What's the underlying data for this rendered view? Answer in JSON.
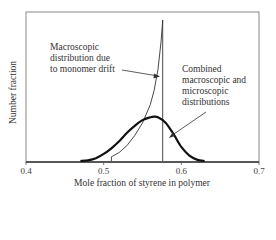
{
  "chart_data": {
    "type": "line",
    "title": "",
    "xlabel": "Mole fraction of styrene in polymer",
    "ylabel": "Number fraction",
    "xlim": [
      0.4,
      0.7
    ],
    "xticks": [
      "0.4",
      "0.5",
      "0.6",
      "0.7"
    ],
    "yticks": [],
    "grid": false,
    "legend": null,
    "series": [
      {
        "name": "Macroscopic distribution due to monomer drift",
        "style": "thin",
        "x": [
          0.51,
          0.51,
          0.52,
          0.53,
          0.54,
          0.55,
          0.56,
          0.565,
          0.57,
          0.574,
          0.576,
          0.576
        ],
        "y": [
          0.0,
          0.03,
          0.06,
          0.11,
          0.18,
          0.27,
          0.4,
          0.5,
          0.65,
          0.85,
          1.0,
          0.0
        ]
      },
      {
        "name": "Combined macroscopic and microscopic distributions",
        "style": "bold",
        "x": [
          0.47,
          0.48,
          0.49,
          0.5,
          0.51,
          0.52,
          0.53,
          0.54,
          0.55,
          0.56,
          0.565,
          0.57,
          0.58,
          0.59,
          0.6,
          0.61,
          0.62,
          0.63
        ],
        "y": [
          0.0,
          0.005,
          0.02,
          0.05,
          0.09,
          0.14,
          0.2,
          0.25,
          0.29,
          0.31,
          0.315,
          0.31,
          0.27,
          0.19,
          0.1,
          0.04,
          0.01,
          0.0
        ]
      }
    ],
    "annotations": [
      {
        "text": "Macroscopic distribution due to monomer drift",
        "arrow_to": [
          0.574,
          0.85
        ]
      },
      {
        "text": "Combined macroscopic and microscopic distributions",
        "arrow_to": [
          0.585,
          0.24
        ]
      }
    ]
  },
  "labels": {
    "ylabel": "Number fraction",
    "xlabel": "Mole fraction of styrene in polymer",
    "annot1": [
      "Macroscopic",
      "distribution due",
      "to monomer drift"
    ],
    "annot2": [
      "Combined",
      "macroscopic and",
      "microscopic",
      "distributions"
    ],
    "ticks": [
      "0.4",
      "0.5",
      "0.6",
      "0.7"
    ]
  }
}
